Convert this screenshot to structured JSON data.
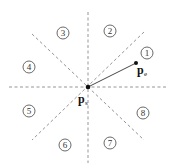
{
  "diagram": {
    "center": {
      "x": 88,
      "y": 87
    },
    "dashed_color": "#888888",
    "lines": [
      {
        "name": "vertical",
        "x1": 88,
        "y1": 12,
        "x2": 88,
        "y2": 163
      },
      {
        "name": "horizontal",
        "x1": 9,
        "y1": 87,
        "x2": 166,
        "y2": 87
      },
      {
        "name": "diag-down",
        "x1": 32,
        "y1": 34,
        "x2": 144,
        "y2": 140
      },
      {
        "name": "diag-up",
        "x1": 144,
        "y1": 32,
        "x2": 32,
        "y2": 140
      }
    ],
    "sectors": [
      {
        "label": "1",
        "x": 147,
        "y": 53
      },
      {
        "label": "2",
        "x": 110,
        "y": 31
      },
      {
        "label": "3",
        "x": 63,
        "y": 33
      },
      {
        "label": "4",
        "x": 29,
        "y": 67
      },
      {
        "label": "5",
        "x": 29,
        "y": 111
      },
      {
        "label": "6",
        "x": 65,
        "y": 145
      },
      {
        "label": "7",
        "x": 110,
        "y": 143
      },
      {
        "label": "8",
        "x": 143,
        "y": 113
      }
    ],
    "points": {
      "start": {
        "main": "p",
        "sub": "s",
        "x": 88,
        "y": 87
      },
      "end": {
        "main": "p",
        "sub": "e",
        "x": 136,
        "y": 63
      }
    }
  }
}
